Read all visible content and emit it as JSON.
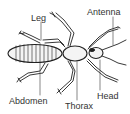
{
  "diagram": {
    "labels": {
      "leg": "Leg",
      "antenna": "Antenna",
      "abdomen": "Abdomen",
      "thorax": "Thorax",
      "head": "Head"
    },
    "colors": {
      "line": "#222222",
      "text": "#333333",
      "background": "#ffffff",
      "body_fill": "#f4f4f4"
    }
  }
}
